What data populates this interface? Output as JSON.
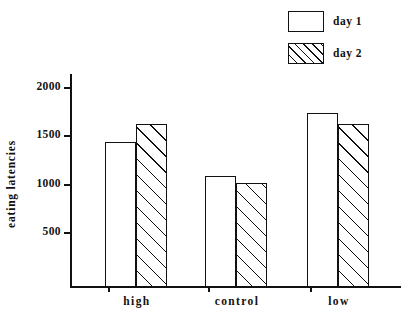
{
  "chart_data": {
    "type": "bar",
    "title": "",
    "xlabel": "",
    "ylabel": "eating latencies",
    "categories": [
      "high",
      "control",
      "low"
    ],
    "series": [
      {
        "name": "day 1",
        "values": [
          1450,
          1110,
          1740
        ]
      },
      {
        "name": "day 2",
        "values": [
          1630,
          1040,
          1630
        ]
      }
    ],
    "ylim": [
      0,
      2100
    ],
    "yticks": [
      500,
      1000,
      1500,
      2000
    ],
    "ytick_labels": [
      "500",
      "1000",
      "1500",
      "2000"
    ],
    "grid": false,
    "legend_position": "top-right"
  },
  "legend": {
    "items": [
      {
        "label": "day 1",
        "fill": "empty"
      },
      {
        "label": "day 2",
        "fill": "hatched"
      }
    ]
  },
  "axes": {
    "y_label": "eating latencies",
    "y_ticks": [
      "2000",
      "1500",
      "1000",
      "500"
    ],
    "x_categories": [
      "high",
      "control",
      "low"
    ]
  },
  "colors": {
    "ink": "#111111",
    "background": "#ffffff"
  }
}
